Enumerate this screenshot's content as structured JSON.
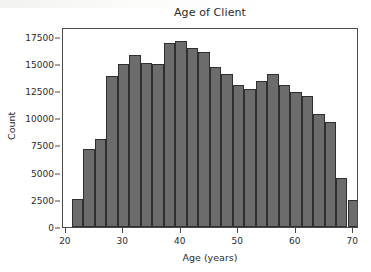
{
  "figure": {
    "title": "Age of Client",
    "background_color": "#ffffff",
    "bar_color": "#6c6c6c",
    "bar_edge_color": "#2f2f2f",
    "axis_color": "#4a4a4a"
  },
  "axes": {
    "x_label": "Age (years)",
    "y_label": "Count",
    "x_ticks": [
      20,
      30,
      40,
      50,
      60,
      70
    ],
    "y_ticks": [
      0,
      2500,
      5000,
      7500,
      10000,
      12500,
      15000,
      17500
    ]
  },
  "chart_data": {
    "type": "bar",
    "title": "Age of Client",
    "xlabel": "Age (years)",
    "ylabel": "Count",
    "xlim": [
      19.5,
      71
    ],
    "ylim": [
      0,
      18400
    ],
    "grid": false,
    "legend": null,
    "bin_width": 2,
    "bin_starts": [
      21,
      23,
      25,
      27,
      29,
      31,
      33,
      35,
      37,
      39,
      41,
      43,
      45,
      47,
      49,
      51,
      53,
      55,
      57,
      59,
      61,
      63,
      65,
      67
    ],
    "categories": [
      "21-23",
      "23-25",
      "25-27",
      "27-29",
      "29-31",
      "31-33",
      "33-35",
      "35-37",
      "37-39",
      "39-41",
      "41-43",
      "43-45",
      "45-47",
      "47-49",
      "49-51",
      "51-53",
      "53-55",
      "55-57",
      "57-59",
      "59-61",
      "61-63",
      "63-65",
      "65-67",
      "67-69"
    ],
    "values": [
      2600,
      7200,
      8100,
      13900,
      15000,
      15800,
      15100,
      15000,
      16900,
      17100,
      16500,
      16100,
      14700,
      14050,
      13100,
      12700,
      13400,
      14100,
      13100,
      12450,
      12050,
      10400,
      9700,
      4500
    ],
    "values_tail": [
      2500
    ]
  }
}
